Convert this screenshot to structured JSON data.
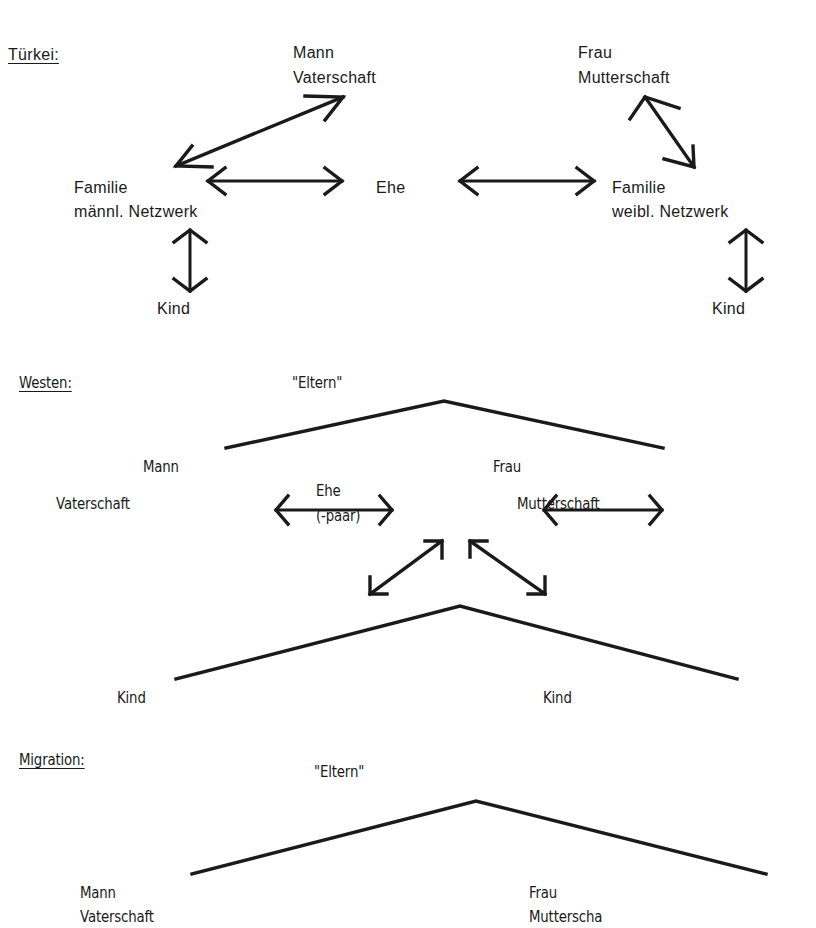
{
  "tuerkei": {
    "heading": "Türkei:",
    "mann": "Mann",
    "vaterschaft": "Vaterschaft",
    "frau": "Frau",
    "mutterschaft": "Mutterschaft",
    "familie_left": "Familie",
    "netzwerk_left": "männl. Netzwerk",
    "ehe": "Ehe",
    "familie_right": "Familie",
    "netzwerk_right": "weibl. Netzwerk",
    "kind_left": "Kind",
    "kind_right": "Kind"
  },
  "westen": {
    "heading": "Westen:",
    "eltern": "\"Eltern\"",
    "mann": "Mann",
    "frau": "Frau",
    "vaterschaft": "Vaterschaft",
    "ehe": "Ehe",
    "paar": "(-paar)",
    "mutterschaft": "Mutterschaft",
    "kind_left": "Kind",
    "kind_right": "Kind"
  },
  "migration": {
    "heading": "Migration:",
    "eltern": "\"Eltern\"",
    "mann": "Mann",
    "vaterschaft": "Vaterschaft",
    "frau": "Frau",
    "mutterschaft": "Mutterscha"
  }
}
